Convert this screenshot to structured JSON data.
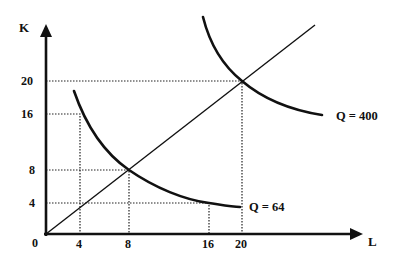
{
  "diagram": {
    "type": "isoquant-map",
    "axes": {
      "x": {
        "label": "L",
        "ticks": [
          "4",
          "8",
          "16",
          "20"
        ]
      },
      "y": {
        "label": "K",
        "ticks": [
          "4",
          "8",
          "16",
          "20"
        ]
      },
      "origin_label": "0"
    },
    "isoquants": [
      {
        "label": "Q = 64",
        "points_on_curve": [
          [
            4,
            16
          ],
          [
            8,
            8
          ],
          [
            16,
            4
          ]
        ]
      },
      {
        "label": "Q = 400",
        "points_on_curve": [
          [
            20,
            20
          ]
        ]
      }
    ],
    "expansion_path": {
      "from": [
        0,
        0
      ],
      "through": [
        [
          4,
          4
        ],
        [
          8,
          8
        ],
        [
          20,
          20
        ]
      ]
    },
    "guide_lines": [
      {
        "type": "dotted",
        "between": [
          [
            0,
            20
          ],
          [
            20,
            20
          ],
          [
            20,
            0
          ]
        ]
      },
      {
        "type": "dotted",
        "between": [
          [
            0,
            16
          ],
          [
            4,
            16
          ],
          [
            4,
            0
          ]
        ]
      },
      {
        "type": "dotted",
        "between": [
          [
            0,
            8
          ],
          [
            8,
            8
          ],
          [
            8,
            0
          ]
        ]
      },
      {
        "type": "dotted",
        "between": [
          [
            0,
            4
          ],
          [
            16,
            4
          ],
          [
            16,
            0
          ]
        ]
      }
    ],
    "colors": {
      "ink": "#111111",
      "background": "#ffffff"
    }
  }
}
